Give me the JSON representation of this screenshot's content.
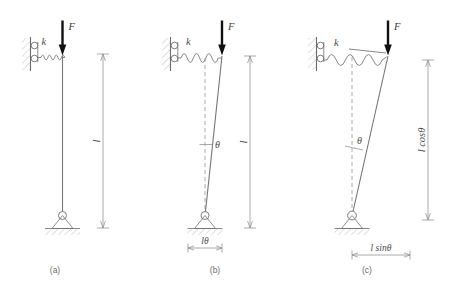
{
  "figure": {
    "type": "engineering-diagram",
    "background_color": "#ffffff",
    "line_color": "#6f6f6f",
    "force_color": "#111111",
    "panels": [
      {
        "id": "a",
        "caption": "(a)",
        "state": "undeformed",
        "force_label": "F",
        "spring_label": "k",
        "length_label": "l",
        "angle_label": null,
        "base_dimension_label": null,
        "vertical_dimension_label": "l",
        "tilt_degrees": 0
      },
      {
        "id": "b",
        "caption": "(b)",
        "state": "small-deflection",
        "force_label": "F",
        "spring_label": "k",
        "length_label": "l",
        "angle_label": "θ",
        "base_dimension_label": "lθ",
        "vertical_dimension_label": "l",
        "tilt_degrees": 4
      },
      {
        "id": "c",
        "caption": "(c)",
        "state": "large-deflection",
        "force_label": "F",
        "spring_label": "k",
        "length_label": "l cosθ",
        "angle_label": "θ",
        "base_dimension_label": "l sinθ",
        "vertical_dimension_label": "l cosθ",
        "tilt_degrees": 13
      }
    ],
    "symbols": {
      "force": "F",
      "spring_constant": "k",
      "length": "l",
      "angle": "θ",
      "length_cos": "l cosθ",
      "length_sin": "l sinθ",
      "length_theta": "lθ"
    },
    "captions": {
      "a": "(a)",
      "b": "(b)",
      "c": "(c)"
    }
  }
}
